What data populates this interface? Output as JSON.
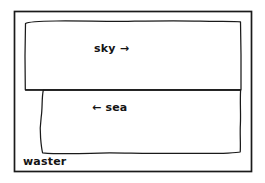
{
  "figure": {
    "background_color": "#ffffff",
    "stroke_color": "#1a1a1a",
    "text_color": "#141414",
    "width": 265,
    "height": 183
  },
  "border": {
    "name": "outer frame",
    "x": 14,
    "y": 11,
    "width": 238,
    "height": 161,
    "stroke_width": 1.6
  },
  "regions": [
    {
      "id": "sky",
      "label": "sky",
      "arrow": "→",
      "arrow_direction": "right",
      "label_text": "sky →",
      "shape": "hand-drawn rectangle",
      "x": 25,
      "y": 21,
      "width": 216,
      "height": 69
    },
    {
      "id": "sea",
      "label": "sea",
      "arrow": "←",
      "arrow_direction": "left",
      "label_text": "← sea",
      "shape": "hand-drawn rectangle",
      "x": 42,
      "y": 90,
      "width": 198,
      "height": 64
    }
  ],
  "annotations": {
    "bottom_left_label": "waster"
  }
}
